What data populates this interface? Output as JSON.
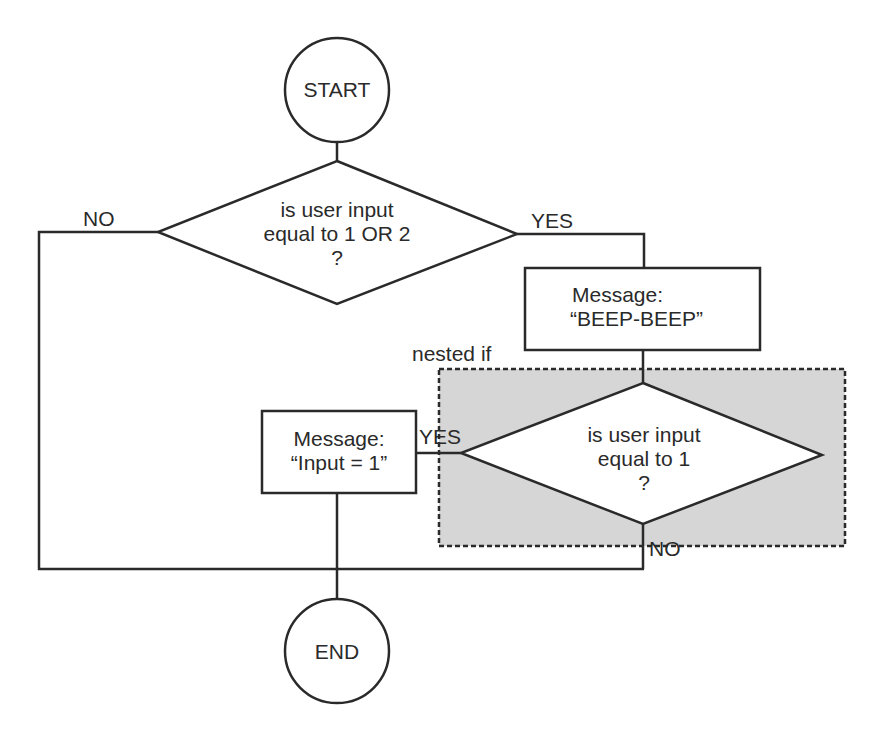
{
  "diagram": {
    "type": "flowchart",
    "colors": {
      "stroke": "#2a2a2a",
      "nested_fill": "#d6d6d6",
      "shape_fill": "#ffffff",
      "background": "#ffffff"
    },
    "nodes": {
      "start": {
        "shape": "circle",
        "label": "START"
      },
      "decision1": {
        "shape": "diamond",
        "lines": [
          "is user input",
          "equal to 1 OR 2",
          "?"
        ]
      },
      "message_beep": {
        "shape": "rectangle",
        "lines": [
          "Message:",
          "“BEEP-BEEP”"
        ]
      },
      "decision2": {
        "shape": "diamond",
        "lines": [
          "is user input",
          "equal to 1",
          "?"
        ]
      },
      "message_input": {
        "shape": "rectangle",
        "lines": [
          "Message:",
          "“Input = 1”"
        ]
      },
      "end": {
        "shape": "circle",
        "label": "END"
      }
    },
    "group": {
      "label": "nested if",
      "style": "dashed",
      "contains": [
        "decision2"
      ]
    },
    "edge_labels": {
      "decision1_no": "NO",
      "decision1_yes": "YES",
      "decision2_yes": "YES",
      "decision2_no": "NO"
    },
    "edges": [
      {
        "from": "start",
        "to": "decision1"
      },
      {
        "from": "decision1",
        "to": "message_beep",
        "label": "YES"
      },
      {
        "from": "decision1",
        "to": "end",
        "label": "NO"
      },
      {
        "from": "message_beep",
        "to": "decision2"
      },
      {
        "from": "decision2",
        "to": "message_input",
        "label": "YES"
      },
      {
        "from": "decision2",
        "to": "end",
        "label": "NO"
      },
      {
        "from": "message_input",
        "to": "end"
      }
    ]
  }
}
